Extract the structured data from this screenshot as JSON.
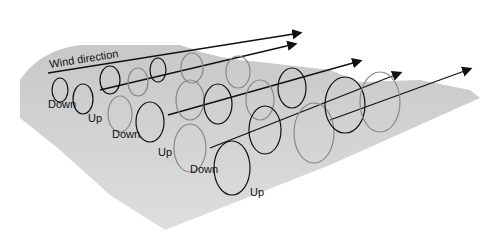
{
  "diagram": {
    "title_label": "Wind direction",
    "labels": [
      {
        "text": "Down",
        "x": 48,
        "y": 108
      },
      {
        "text": "Up",
        "x": 88,
        "y": 122
      },
      {
        "text": "Down",
        "x": 112,
        "y": 138
      },
      {
        "text": "Up",
        "x": 158,
        "y": 156
      },
      {
        "text": "Down",
        "x": 190,
        "y": 173
      },
      {
        "text": "Up",
        "x": 250,
        "y": 196
      }
    ],
    "colors": {
      "surface": "#d4d4d4",
      "surface_dark": "#b8b8b8",
      "arrow_black": "#111111",
      "arrow_gray": "#9a9a9a"
    }
  }
}
